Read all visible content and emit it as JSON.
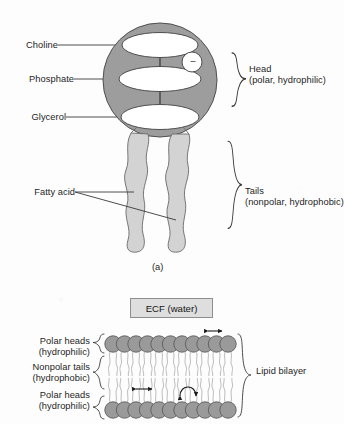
{
  "figure": {
    "panel_a": {
      "caption": "(a)",
      "left_labels": [
        {
          "text": "Choline",
          "target": "outer-head-ellipse"
        },
        {
          "text": "Phosphate",
          "target": "middle-head-ellipse"
        },
        {
          "text": "Glycerol",
          "target": "inner-head-ellipse"
        }
      ],
      "fatty_acid_label": "Fatty acid",
      "charge_symbol": "–",
      "right_brace_labels": [
        {
          "title": "Head",
          "subtitle": "(polar, hydrophilic)"
        },
        {
          "title": "Tails",
          "subtitle": "(nonpolar, hydrophobic)"
        }
      ]
    },
    "panel_b": {
      "ecf_label": "ECF (water)",
      "left_brace_labels": [
        {
          "title": "Polar heads",
          "subtitle": "(hydrophilic)"
        },
        {
          "title": "Nonpolar tails",
          "subtitle": "(hydrophobic)"
        },
        {
          "title": "Polar heads",
          "subtitle": "(hydrophilic)"
        }
      ],
      "right_brace_label": "Lipid bilayer",
      "head_count_per_row": 12,
      "motion_arrows": [
        "lateral-diffusion-top",
        "lateral-diffusion-middle",
        "rotation"
      ]
    }
  },
  "colors": {
    "head_gray": "#9d9d9d",
    "tail_gray": "#d3d3d3",
    "bilayer_head_gray": "#9a9a9a",
    "ecf_box_fill": "#dedede",
    "outline": "#4a4a4a",
    "text": "#1d1d1d",
    "background": "#fdfdfd"
  }
}
